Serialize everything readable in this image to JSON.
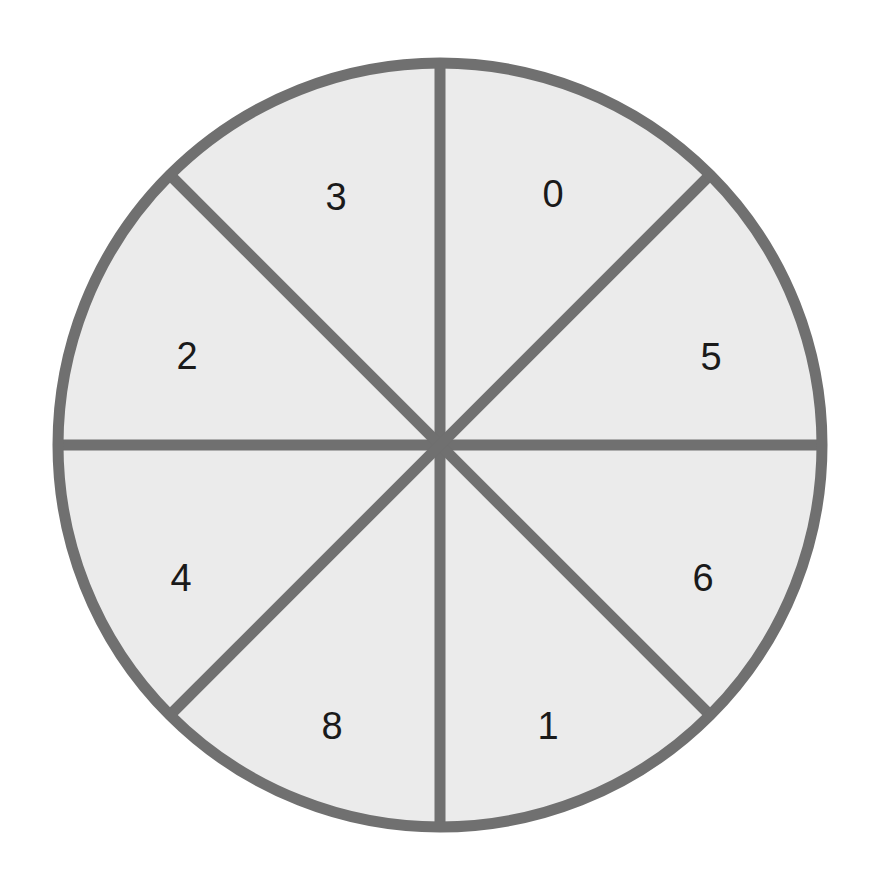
{
  "figure": {
    "name": "sector-wheel",
    "background_color": "#ffffff"
  },
  "chart_data": {
    "type": "pie",
    "title": "",
    "subtitle": "",
    "xlabel": "",
    "ylabel": "",
    "grid": false,
    "legend": "none",
    "slice_count": 8,
    "equal_slices": true,
    "slice_angle_degrees": 45,
    "categories": [
      "0",
      "5",
      "6",
      "1",
      "8",
      "4",
      "2",
      "3"
    ],
    "values": [
      45,
      45,
      45,
      45,
      45,
      45,
      45,
      45
    ],
    "labels_clockwise_from_top": [
      "0",
      "5",
      "6",
      "1",
      "8",
      "4",
      "2",
      "3"
    ],
    "colors": {
      "slice_fill": "#ebebeb",
      "outline": "#707070",
      "divider": "#707070",
      "label_text": "#1a1a1a",
      "background": "#ffffff"
    },
    "geometry": {
      "center_x": 440,
      "center_y": 445,
      "radius": 382,
      "stroke_width": 11,
      "label_radius": 248
    },
    "slices": [
      {
        "label": "0",
        "value": 45,
        "start_angle_deg": 0,
        "end_angle_deg": 45,
        "mid_angle_deg": 22.5,
        "label_x": 553,
        "label_y": 194,
        "fill": "#ebebeb"
      },
      {
        "label": "5",
        "value": 45,
        "start_angle_deg": 45,
        "end_angle_deg": 90,
        "mid_angle_deg": 67.5,
        "label_x": 711,
        "label_y": 357,
        "fill": "#ebebeb"
      },
      {
        "label": "6",
        "value": 45,
        "start_angle_deg": 90,
        "end_angle_deg": 135,
        "mid_angle_deg": 112.5,
        "label_x": 703,
        "label_y": 578,
        "fill": "#ebebeb"
      },
      {
        "label": "1",
        "value": 45,
        "start_angle_deg": 135,
        "end_angle_deg": 180,
        "mid_angle_deg": 157.5,
        "label_x": 548,
        "label_y": 726,
        "fill": "#ebebeb"
      },
      {
        "label": "8",
        "value": 45,
        "start_angle_deg": 180,
        "end_angle_deg": 225,
        "mid_angle_deg": 202.5,
        "label_x": 332,
        "label_y": 726,
        "fill": "#ebebeb"
      },
      {
        "label": "4",
        "value": 45,
        "start_angle_deg": 225,
        "end_angle_deg": 270,
        "mid_angle_deg": 247.5,
        "label_x": 181,
        "label_y": 578,
        "fill": "#ebebeb"
      },
      {
        "label": "2",
        "value": 45,
        "start_angle_deg": 270,
        "end_angle_deg": 315,
        "mid_angle_deg": 292.5,
        "label_x": 187,
        "label_y": 356,
        "fill": "#ebebeb"
      },
      {
        "label": "3",
        "value": 45,
        "start_angle_deg": 315,
        "end_angle_deg": 360,
        "mid_angle_deg": 337.5,
        "label_x": 336,
        "label_y": 197,
        "fill": "#ebebeb"
      }
    ],
    "dividers": [
      {
        "name": "vertical-divider",
        "x1": 440,
        "y1": 63,
        "x2": 440,
        "y2": 827
      },
      {
        "name": "horizontal-divider",
        "x1": 58,
        "y1": 445,
        "x2": 822,
        "y2": 445
      },
      {
        "name": "diagonal-divider-nw-se",
        "x1": 170,
        "y1": 175,
        "x2": 710,
        "y2": 715
      },
      {
        "name": "diagonal-divider-ne-sw",
        "x1": 710,
        "y1": 175,
        "x2": 170,
        "y2": 715
      }
    ]
  }
}
